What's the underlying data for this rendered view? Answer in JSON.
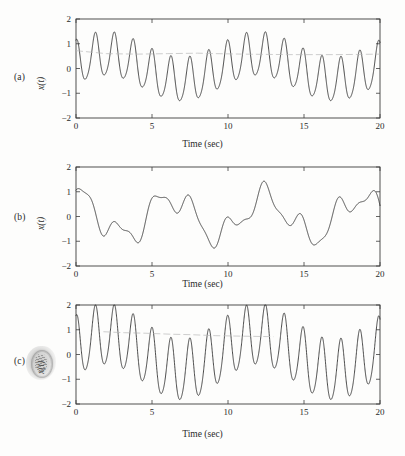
{
  "figure": {
    "background_color": "#fdfdfc",
    "trace_color": "#2b2b2b",
    "faint_trace_color": "#b9b9b9",
    "axis_color": "#3c3c3c"
  },
  "panels": [
    {
      "tag": "(a)",
      "ylabel": "x(t)",
      "xlabel": "Time (sec)"
    },
    {
      "tag": "(b)",
      "ylabel": "x(t)",
      "xlabel": "Time (sec)"
    },
    {
      "tag": "(c)",
      "ylabel": "x(t)",
      "xlabel": "Time (sec)"
    }
  ],
  "ticks": {
    "x": [
      "0",
      "5",
      "10",
      "15",
      "20"
    ],
    "y": [
      "2",
      "1",
      "0",
      "-1",
      "-2"
    ]
  },
  "chart_data": [
    {
      "type": "line",
      "title": "",
      "panel": "(a)",
      "xlabel": "Time (sec)",
      "ylabel": "x(t)",
      "xlim": [
        0,
        20
      ],
      "ylim": [
        -2,
        2
      ],
      "xticks": [
        0,
        5,
        10,
        15,
        20
      ],
      "yticks": [
        -2,
        -1,
        0,
        1,
        2
      ],
      "grid": false,
      "legend": "none",
      "series": [
        {
          "name": "x(t)",
          "description": "Sum of two sinusoids: 0.9*sin(2*pi*0.8*t) + 0.55*sin(2*pi*0.18*t + 0.6) plus slow drift; fast carrier ~0.8 Hz, beat envelope period ~6.2 s",
          "model": "0.88*sin(2*pi*0.805*t + 1.45) + 0.52*sin(2*pi*0.1*t + 0.35) + 0.12*sin(2*pi*1.6*t)",
          "peak_max": 1.55,
          "peak_min": -1.45,
          "x_sample": [
            0,
            0.5,
            1.2,
            2.2,
            3.0,
            3.7,
            4.5,
            5.2,
            6.0,
            6.8,
            7.5,
            8.3,
            9.1,
            10.0,
            10.8,
            11.5,
            12.3,
            13.1,
            13.9,
            14.7,
            15.4,
            16.2,
            17.0,
            17.8,
            18.6,
            19.3,
            20.0
          ],
          "y_sample": [
            0.95,
            -0.62,
            1.12,
            -1.28,
            0.52,
            -1.42,
            1.02,
            -0.78,
            1.53,
            -0.82,
            1.18,
            -1.32,
            0.62,
            -1.45,
            0.88,
            -0.74,
            1.45,
            -0.8,
            1.18,
            -1.28,
            0.55,
            -1.18,
            0.92,
            -0.7,
            1.55,
            -0.8,
            1.05
          ]
        },
        {
          "name": "envelope-baseline",
          "style": "faint-gray",
          "description": "Faint light-gray near-horizontal scan artifact line at about y = 0.6 spanning t = 0 to t = 20",
          "x_sample": [
            0,
            2,
            4,
            6,
            8,
            9.2,
            11,
            14,
            17,
            20
          ],
          "y_sample": [
            0.72,
            0.6,
            0.58,
            0.6,
            0.62,
            0.6,
            0.58,
            0.56,
            0.56,
            0.58
          ]
        }
      ]
    },
    {
      "type": "line",
      "title": "",
      "panel": "(b)",
      "xlabel": "Time (sec)",
      "ylabel": "x(t)",
      "xlim": [
        0,
        20
      ],
      "ylim": [
        -2,
        2
      ],
      "xticks": [
        0,
        5,
        10,
        15,
        20
      ],
      "yticks": [
        -2,
        -1,
        0,
        1,
        2
      ],
      "grid": false,
      "legend": "none",
      "series": [
        {
          "name": "x(t)",
          "description": "Low-frequency version: dominant ~0.16 Hz component with ~0.4 Hz ripple, smoother than (a), repeats roughly every 6.2 s",
          "model": "0.9*sin(2*pi*0.161*t + 1.5) + 0.45*sin(2*pi*0.42*t + 0.3)",
          "peak_max": 1.55,
          "peak_min": -1.4,
          "x_sample": [
            0,
            0.6,
            1.3,
            2.2,
            2.9,
            3.6,
            4.4,
            5.0,
            6.0,
            6.8,
            7.4,
            8.4,
            9.1,
            10.0,
            10.8,
            11.3,
            12.3,
            13.0,
            13.8,
            14.7,
            15.4,
            16.2,
            17.2,
            17.8,
            18.6,
            19.4,
            20.0
          ],
          "y_sample": [
            1.2,
            0.45,
            0.8,
            -1.05,
            -0.48,
            -1.4,
            0.05,
            -0.08,
            1.55,
            0.42,
            0.92,
            -1.05,
            -0.55,
            -1.4,
            0.28,
            0.22,
            1.55,
            0.5,
            0.98,
            -1.02,
            -0.6,
            -1.38,
            0.32,
            0.2,
            1.53,
            0.45,
            0.78
          ]
        }
      ]
    },
    {
      "type": "line",
      "title": "",
      "panel": "(c)",
      "xlabel": "Time (sec)",
      "ylabel": "x(t)",
      "xlim": [
        0,
        20
      ],
      "ylim": [
        -2,
        2
      ],
      "xticks": [
        0,
        5,
        10,
        15,
        20
      ],
      "yticks": [
        -2,
        -1,
        0,
        1,
        2
      ],
      "grid": false,
      "legend": "none",
      "series": [
        {
          "name": "x(t)",
          "description": "Same structure as (a) but larger amplitude, clipping near +/-2 at beat maxima (t ~ 6, 10, 12.4, 18.6)",
          "model": "1.25*sin(2*pi*0.805*t + 1.45) + 0.70*sin(2*pi*0.1*t + 0.35)",
          "peak_max": 2.0,
          "peak_min": -1.95,
          "x_sample": [
            0,
            0.5,
            1.2,
            2.2,
            3.0,
            3.7,
            4.5,
            5.2,
            6.0,
            6.8,
            7.5,
            8.3,
            9.1,
            10.0,
            10.8,
            11.5,
            12.3,
            13.1,
            13.9,
            14.7,
            15.4,
            16.2,
            17.0,
            17.8,
            18.6,
            19.3,
            20.0
          ],
          "y_sample": [
            1.35,
            -0.2,
            1.2,
            -1.55,
            0.02,
            -1.85,
            1.05,
            -0.52,
            2.0,
            -0.58,
            1.35,
            -1.58,
            0.45,
            -1.95,
            0.78,
            -0.48,
            2.0,
            -0.5,
            1.35,
            -1.52,
            0.05,
            -1.82,
            0.8,
            -0.45,
            2.0,
            -0.4,
            1.15
          ]
        },
        {
          "name": "envelope-baseline",
          "style": "faint-gray",
          "description": "Faint light-gray broken scan artifact line near y = 0.85 descending to about y = 0.70, spanning t = 1.8 to t = 13",
          "x_sample": [
            1.8,
            3.2,
            4.6,
            6.2,
            7.6,
            9.2,
            11.0,
            13.0
          ],
          "y_sample": [
            0.92,
            0.88,
            0.86,
            0.82,
            0.8,
            0.76,
            0.74,
            0.72
          ]
        }
      ]
    }
  ]
}
